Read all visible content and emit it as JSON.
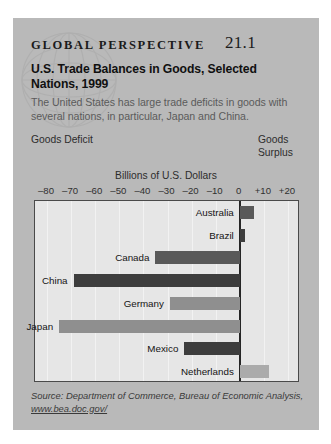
{
  "box": {
    "kicker": "GLOBAL  PERSPECTIVE",
    "number": "21.1",
    "headline": "U.S. Trade Balances in Goods, Selected Nations, 1999",
    "subtext": "The United States has large trade deficits in goods with several nations, in particular, Japan and China.",
    "left_label": "Goods Deficit",
    "right_label": "Goods Surplus",
    "source": "Source: Department of Commerce, Bureau of Economic Analysis,",
    "source_url": "www.bea.doc.gov/"
  },
  "colors": {
    "panel": "#b9b9b9",
    "plot_bg": "#e6e6e6",
    "zero_line": "#262626",
    "bar_darkest": "#3d3d3d",
    "bar_dark": "#595959",
    "bar_mid": "#8f8f8f",
    "bar_light": "#ababab"
  },
  "chart_data": {
    "type": "bar",
    "orientation": "horizontal",
    "title": "U.S. Trade Balances in Goods, Selected Nations, 1999",
    "xlabel": "Billions of U.S. Dollars",
    "ylabel": "",
    "xlim": [
      -85,
      25
    ],
    "xticks": [
      -80,
      -70,
      -60,
      -50,
      -40,
      -30,
      -20,
      -10,
      0,
      10,
      20
    ],
    "xticklabels": [
      "–80",
      "–70",
      "–60",
      "–50",
      "–40",
      "–30",
      "–20",
      "–10",
      "0",
      "+10",
      "+20"
    ],
    "grid": true,
    "legend": null,
    "categories": [
      "Australia",
      "Brazil",
      "Canada",
      "China",
      "Germany",
      "Japan",
      "Mexico",
      "Netherlands"
    ],
    "values": [
      6,
      2,
      -35,
      -69,
      -29,
      -75,
      -23,
      12
    ],
    "bars": [
      {
        "label": "Australia",
        "value": 6,
        "color": "#595959"
      },
      {
        "label": "Brazil",
        "value": 2,
        "color": "#3d3d3d"
      },
      {
        "label": "Canada",
        "value": -35,
        "color": "#595959"
      },
      {
        "label": "China",
        "value": -69,
        "color": "#3d3d3d"
      },
      {
        "label": "Germany",
        "value": -29,
        "color": "#8f8f8f"
      },
      {
        "label": "Japan",
        "value": -75,
        "color": "#8f8f8f"
      },
      {
        "label": "Mexico",
        "value": -23,
        "color": "#3d3d3d"
      },
      {
        "label": "Netherlands",
        "value": 12,
        "color": "#ababab"
      }
    ]
  }
}
